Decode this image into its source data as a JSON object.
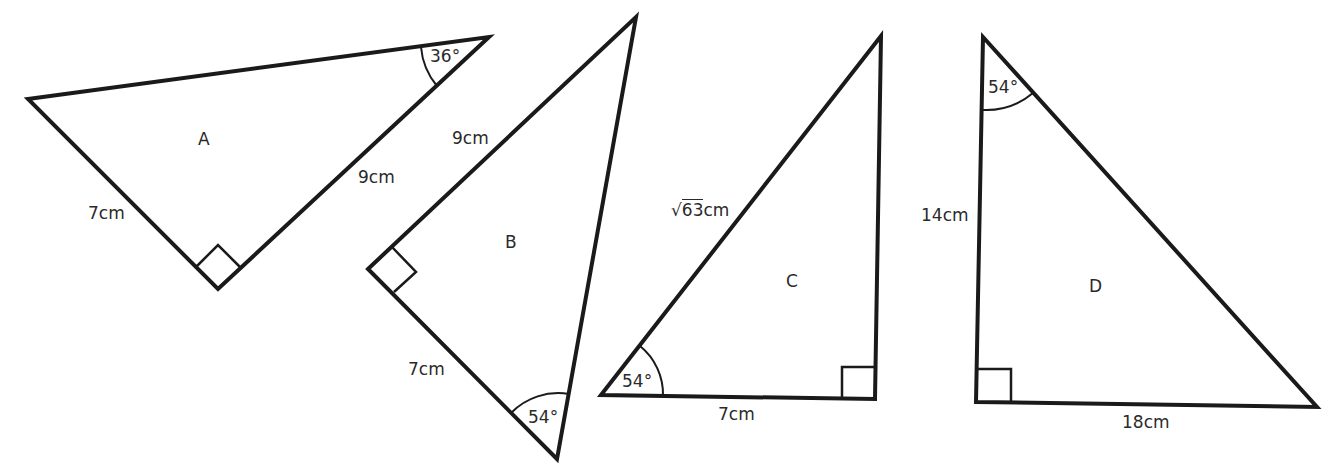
{
  "diagram": {
    "type": "right-angled triangles",
    "triangles": [
      {
        "name": "A",
        "sides": [
          "7cm",
          "9cm"
        ],
        "angle": "36°",
        "right_angle": true
      },
      {
        "name": "B",
        "sides": [
          "9cm",
          "7cm"
        ],
        "angle": "54°",
        "right_angle": true
      },
      {
        "name": "C",
        "sides": [
          "√63cm",
          "7cm"
        ],
        "sqrt_value": "63",
        "sqrt_unit": "cm",
        "angle": "54°",
        "right_angle": true
      },
      {
        "name": "D",
        "sides": [
          "14cm",
          "18cm"
        ],
        "angle": "54°",
        "right_angle": true
      }
    ]
  },
  "colors": {
    "stroke": "#1a1a1a",
    "text": "#2a2a2a",
    "background": "#ffffff"
  }
}
